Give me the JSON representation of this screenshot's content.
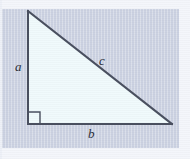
{
  "figure": {
    "kind": "geometry-diagram",
    "width": 190,
    "height": 159
  },
  "colors": {
    "page_background": "#ffffff",
    "frame_band": "#f4f6fb",
    "plate_background": "#ccd2e2",
    "triangle_fill": "#f0fafc",
    "stroke": "#4a5060",
    "label_color": "#2b2f3a"
  },
  "triangle": {
    "vertices": {
      "top": {
        "x": 28,
        "y": 11
      },
      "bottom_left": {
        "x": 28,
        "y": 124
      },
      "bottom_right": {
        "x": 172,
        "y": 124
      }
    },
    "sides": [
      {
        "name": "vertical-leg",
        "label": "a",
        "from": "top",
        "to": "bottom_left"
      },
      {
        "name": "horizontal-leg",
        "label": "b",
        "from": "bottom_left",
        "to": "bottom_right"
      },
      {
        "name": "hypotenuse",
        "label": "c",
        "from": "top",
        "to": "bottom_right"
      }
    ],
    "right_angle": {
      "at": "bottom_left",
      "marker": "square",
      "size": 12
    }
  },
  "labels": {
    "leg_a": "a",
    "leg_b": "b",
    "hypotenuse_c": "c"
  }
}
